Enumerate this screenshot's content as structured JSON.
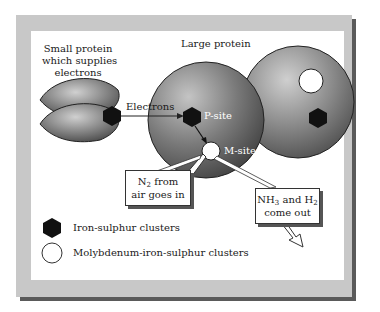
{
  "diagram": {
    "small_protein_label": [
      "Small protein",
      "which supplies",
      "electrons"
    ],
    "large_protein_label": "Large protein",
    "electrons_label": "Electrons",
    "p_site_label": "P-site",
    "m_site_label": "M-site",
    "n2_callout": {
      "line1_prefix": "N",
      "line1_sub": "2",
      "line1_suffix": " from",
      "line2": "air goes in"
    },
    "nh3_callout": {
      "part1": "NH",
      "sub1": "3",
      "part2": " and H",
      "sub2": "2",
      "line2": "come out"
    }
  },
  "legend": {
    "items": [
      {
        "icon": "hexagon-icon",
        "label": "Iron-sulphur clusters"
      },
      {
        "icon": "circle-icon",
        "label": "Molybdenum-iron-sulphur clusters"
      }
    ]
  },
  "colors": {
    "frame": "#c8c8c8",
    "frame_shadow": "#5a5a5a",
    "panel": "#ffffff",
    "protein_light": "#a8a8a8",
    "protein_dark": "#4a4a4a",
    "cluster": "#111111"
  }
}
